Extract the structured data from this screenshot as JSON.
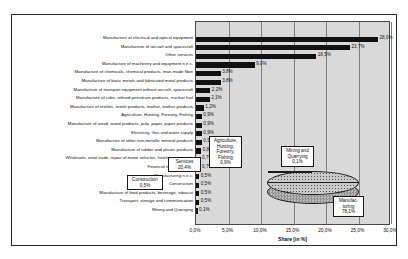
{
  "chart_data": {
    "type": "bar",
    "title": "",
    "xlabel": "Share [in %]",
    "ylabel": "",
    "xlim": [
      0,
      30
    ],
    "grid": true,
    "orientation": "horizontal",
    "tick_labels": [
      "0,0%",
      "5,0%",
      "10,0%",
      "15,0%",
      "20,0%",
      "25,0%",
      "30,0%"
    ],
    "tick_values": [
      0,
      5,
      10,
      15,
      20,
      25,
      30
    ],
    "categories": [
      "Manufacture of electrical and optical equipment",
      "Manufacture of aircraft and spacecraft",
      "Other services",
      "Manufacture of machinery and equipment n.e.c.",
      "Manufacture of chemicals, chemical products, man-made fibre",
      "Manufacture of basic metals and fabricated metal products",
      "Manufacture of transport equipment without aircraft, spacecraft",
      "Manufacture of coke, refined petroleum products, nuclear fuel",
      "Manufacture of textiles, textile products, leather, leather products",
      "Agriculture, Hunting, Forestry, Fishing",
      "Manufacture of wood, wood products, pulp, paper, paper products",
      "Electricity, Gas and water supply",
      "Manufacture of other non-metallic mineral products",
      "Manufacture of rubber and plastic products",
      "Wholesale, retail trade, repair of motor vehicles, hotels, restaurants",
      "Financial intermediation",
      "Manufacturing n.e.c.",
      "Construction",
      "Manufacture of food products, beverage, tobacco",
      "Transport, storage and communication",
      "Mining and Quarrying"
    ],
    "values": [
      28.0,
      23.7,
      18.5,
      9.0,
      3.8,
      3.8,
      2.2,
      2.1,
      1.2,
      0.9,
      0.9,
      0.9,
      0.9,
      0.8,
      0.7,
      0.7,
      0.5,
      0.5,
      0.5,
      0.5,
      0.1
    ],
    "value_labels": [
      "28,0%",
      "23,7%",
      "18,5%",
      "9,0%",
      "3,8%",
      "3,8%",
      "2,2%",
      "2,1%",
      "1,2%",
      "0,9%",
      "0,9%",
      "0,9%",
      "0,9%",
      "0,8%",
      "0,7%",
      "0,7%",
      "0,5%",
      "0,5%",
      "0,5%",
      "0,5%",
      "0,1%"
    ]
  },
  "pie_chart": {
    "type": "pie",
    "labels": [
      "Construction",
      "Services",
      "Agriculture, Hunting, Forestry, Fishing",
      "Mining and Quarrying",
      "Manufacturing"
    ],
    "value_labels": [
      "0,5%",
      "20,4%",
      "0,9%",
      "0,1%",
      "78,1%"
    ],
    "values": [
      0.5,
      20.4,
      0.9,
      0.1,
      78.1
    ],
    "callouts": [
      {
        "name": "Construction",
        "value": "0,5%"
      },
      {
        "name": "Services",
        "value": "20,4%"
      },
      {
        "name": "Agriculture, Hunting, Forestry, Fishing",
        "value": "0,9%"
      },
      {
        "name": "Mining and Quarrying",
        "value": "0,1%"
      },
      {
        "name": "Manufac- turing",
        "value": "78,1%"
      }
    ],
    "agriculture_lines": [
      "Agriculture,",
      "Hunting,",
      "Forestry,",
      "Fishing"
    ],
    "mining_lines": [
      "Mining and",
      "Quarrying"
    ],
    "manufacturing_lines": [
      "Manufac-",
      "turing"
    ]
  }
}
